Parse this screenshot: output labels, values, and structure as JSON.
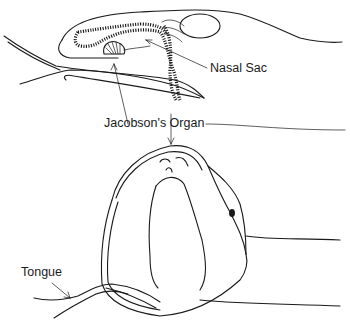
{
  "figure": {
    "labels": {
      "nasal_sac": "Nasal Sac",
      "jacobsons_organ": "Jacobson's Organ",
      "tongue": "Tongue"
    },
    "panels": [
      {
        "id": "sagittal-section",
        "description": "Side cross-section of snout with nasal sac and Jacobson's organ"
      },
      {
        "id": "open-mouth-view",
        "description": "Head with mouth open showing palate openings and forked tongue"
      }
    ],
    "colors": {
      "ink": "#1a1a1a",
      "background": "#ffffff"
    }
  }
}
